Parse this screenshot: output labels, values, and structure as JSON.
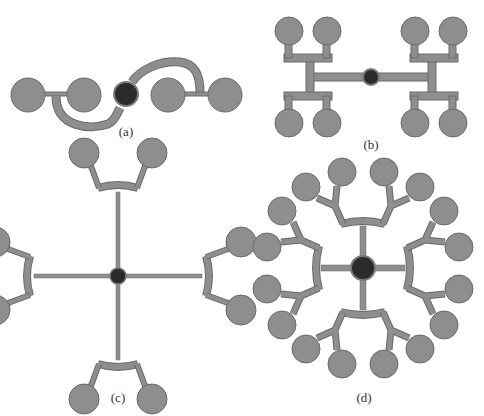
{
  "colors": {
    "pad": "#8e8e8e",
    "outline": "#6a6a6a",
    "trace": "#8e8e8e",
    "center": "#2b2b2b",
    "center_ring": "#7a7a7a"
  },
  "panels": [
    {
      "id": "a",
      "label": "(a)",
      "label_x": 126,
      "label_y": 133,
      "description": "2-way spiral feed network with 4 pads"
    },
    {
      "id": "b",
      "label": "(b)",
      "label_x": 371,
      "label_y": 139,
      "description": "H-tree feed network with 8 pads"
    },
    {
      "id": "c",
      "label": "(c)",
      "label_x": 118,
      "label_y": 389,
      "description": "radial feed network with 8 pads"
    },
    {
      "id": "d",
      "label": "(d)",
      "label_x": 364,
      "label_y": 389,
      "description": "radial feed network with 16 pads"
    }
  ]
}
